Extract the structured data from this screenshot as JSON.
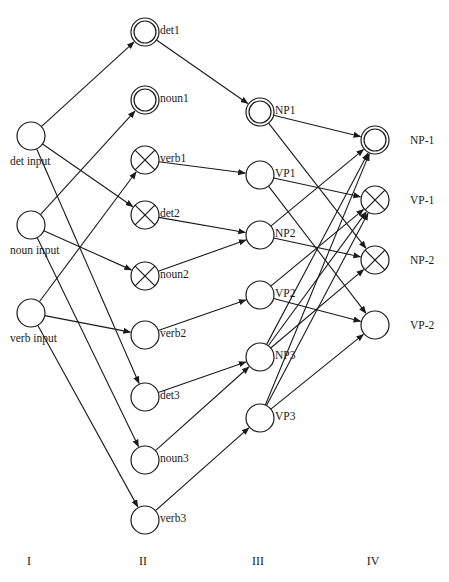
{
  "diagram": {
    "type": "layered neural network",
    "node_radius": 14,
    "columns": [
      {
        "id": "I",
        "label": "I",
        "x": 31,
        "label_y": 565
      },
      {
        "id": "II",
        "label": "II",
        "x": 145,
        "label_y": 565
      },
      {
        "id": "III",
        "label": "III",
        "x": 260,
        "label_y": 565
      },
      {
        "id": "IV",
        "label": "IV",
        "x": 375,
        "label_y": 565
      }
    ],
    "nodes": [
      {
        "id": "det_input",
        "label": "det input",
        "col": "I",
        "x": 31,
        "y": 136,
        "style": "plain",
        "label_pos": "below"
      },
      {
        "id": "noun_input",
        "label": "noun input",
        "col": "I",
        "x": 31,
        "y": 225,
        "style": "plain",
        "label_pos": "below"
      },
      {
        "id": "verb_input",
        "label": "verb input",
        "col": "I",
        "x": 31,
        "y": 313,
        "style": "plain",
        "label_pos": "below"
      },
      {
        "id": "det1",
        "label": "det1",
        "col": "II",
        "x": 145,
        "y": 32,
        "style": "double",
        "label_pos": "right"
      },
      {
        "id": "noun1",
        "label": "noun1",
        "col": "II",
        "x": 145,
        "y": 100,
        "style": "double",
        "label_pos": "right"
      },
      {
        "id": "verb1",
        "label": "verb1",
        "col": "II",
        "x": 145,
        "y": 160,
        "style": "crossed",
        "label_pos": "right"
      },
      {
        "id": "det2",
        "label": "det2",
        "col": "II",
        "x": 145,
        "y": 215,
        "style": "crossed",
        "label_pos": "right"
      },
      {
        "id": "noun2",
        "label": "noun2",
        "col": "II",
        "x": 145,
        "y": 276,
        "style": "crossed",
        "label_pos": "right"
      },
      {
        "id": "verb2",
        "label": "verb2",
        "col": "II",
        "x": 145,
        "y": 335,
        "style": "plain",
        "label_pos": "right"
      },
      {
        "id": "det3",
        "label": "det3",
        "col": "II",
        "x": 145,
        "y": 397,
        "style": "plain",
        "label_pos": "right"
      },
      {
        "id": "noun3",
        "label": "noun3",
        "col": "II",
        "x": 145,
        "y": 460,
        "style": "plain",
        "label_pos": "right"
      },
      {
        "id": "verb3",
        "label": "verb3",
        "col": "II",
        "x": 145,
        "y": 520,
        "style": "plain",
        "label_pos": "right"
      },
      {
        "id": "NP1",
        "label": "NP1",
        "col": "III",
        "x": 260,
        "y": 112,
        "style": "double",
        "label_pos": "right"
      },
      {
        "id": "VP1",
        "label": "VP1",
        "col": "III",
        "x": 260,
        "y": 175,
        "style": "plain",
        "label_pos": "right"
      },
      {
        "id": "NP2",
        "label": "NP2",
        "col": "III",
        "x": 260,
        "y": 235,
        "style": "plain",
        "label_pos": "right"
      },
      {
        "id": "VP2",
        "label": "VP2",
        "col": "III",
        "x": 260,
        "y": 295,
        "style": "plain",
        "label_pos": "right"
      },
      {
        "id": "NP3",
        "label": "NP3",
        "col": "III",
        "x": 260,
        "y": 357,
        "style": "plain",
        "label_pos": "right"
      },
      {
        "id": "VP3",
        "label": "VP3",
        "col": "III",
        "x": 260,
        "y": 418,
        "style": "plain",
        "label_pos": "right"
      },
      {
        "id": "NP-1",
        "label": "NP-1",
        "col": "IV",
        "x": 375,
        "y": 140,
        "style": "double",
        "label_pos": "far-right"
      },
      {
        "id": "VP-1",
        "label": "VP-1",
        "col": "IV",
        "x": 375,
        "y": 200,
        "style": "crossed",
        "label_pos": "far-right"
      },
      {
        "id": "NP-2",
        "label": "NP-2",
        "col": "IV",
        "x": 375,
        "y": 260,
        "style": "crossed",
        "label_pos": "far-right"
      },
      {
        "id": "VP-2",
        "label": "VP-2",
        "col": "IV",
        "x": 375,
        "y": 325,
        "style": "plain",
        "label_pos": "far-right"
      }
    ],
    "edges": [
      [
        "det_input",
        "det1"
      ],
      [
        "det_input",
        "det2"
      ],
      [
        "det_input",
        "det3"
      ],
      [
        "noun_input",
        "noun1"
      ],
      [
        "noun_input",
        "noun2"
      ],
      [
        "noun_input",
        "noun3"
      ],
      [
        "verb_input",
        "verb1"
      ],
      [
        "verb_input",
        "verb2"
      ],
      [
        "verb_input",
        "verb3"
      ],
      [
        "det1",
        "NP1"
      ],
      [
        "verb1",
        "VP1"
      ],
      [
        "det2",
        "NP2"
      ],
      [
        "noun2",
        "NP2"
      ],
      [
        "verb2",
        "VP2"
      ],
      [
        "det3",
        "NP3"
      ],
      [
        "noun3",
        "NP3"
      ],
      [
        "verb3",
        "VP3"
      ],
      [
        "NP1",
        "NP-1"
      ],
      [
        "NP1",
        "NP-2"
      ],
      [
        "VP1",
        "VP-1"
      ],
      [
        "VP1",
        "VP-2"
      ],
      [
        "NP2",
        "NP-1"
      ],
      [
        "NP2",
        "NP-2"
      ],
      [
        "VP2",
        "VP-1"
      ],
      [
        "VP2",
        "VP-2"
      ],
      [
        "NP3",
        "NP-1"
      ],
      [
        "NP3",
        "VP-1"
      ],
      [
        "NP3",
        "NP-2"
      ],
      [
        "VP3",
        "NP-1"
      ],
      [
        "VP3",
        "VP-1"
      ],
      [
        "VP3",
        "VP-2"
      ]
    ],
    "legend_styles": {
      "double": "double-ring circle (active)",
      "crossed": "circle with X (inhibited)",
      "plain": "plain circle"
    },
    "colors": {
      "stroke": "#1a1a1a",
      "background": "#ffffff"
    }
  }
}
